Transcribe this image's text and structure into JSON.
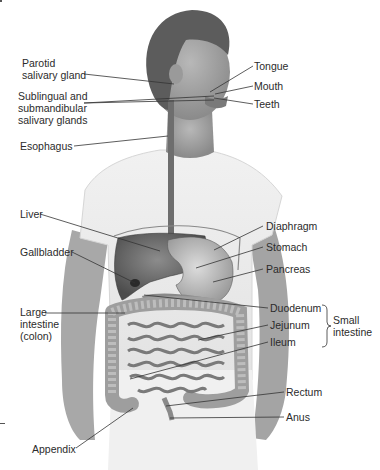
{
  "figure": {
    "labels": {
      "parotid": "Parotid salivary gland",
      "parotid_l1": "Parotid",
      "parotid_l2": "salivary gland",
      "sublingual_l1": "Sublingual and",
      "sublingual_l2": "submandibular",
      "sublingual_l3": "salivary glands",
      "esophagus": "Esophagus",
      "tongue": "Tongue",
      "mouth": "Mouth",
      "teeth": "Teeth",
      "liver": "Liver",
      "gallbladder": "Gallbladder",
      "large_intestine_l1": "Large",
      "large_intestine_l2": "intestine",
      "large_intestine_l3": "(colon)",
      "diaphragm": "Diaphragm",
      "stomach": "Stomach",
      "pancreas": "Pancreas",
      "duodenum": "Duodenum",
      "jejunum": "Jejunum",
      "ileum": "Ileum",
      "small_intestine_l1": "Small",
      "small_intestine_l2": "intestine",
      "rectum": "Rectum",
      "anus": "Anus",
      "appendix": "Appendix"
    },
    "colors": {
      "organ": "#6e6e6e",
      "organ_dark": "#4a4a4a",
      "intestine": "#9a9a9a",
      "skin": "#9c9c9c",
      "hair": "#5a5a5a",
      "shirt": "#ececec",
      "leader": "#333333"
    }
  }
}
